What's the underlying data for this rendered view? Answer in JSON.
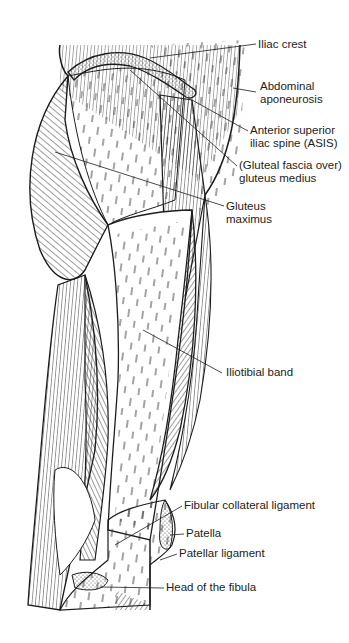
{
  "figure": {
    "line_color": "#1c1c1c",
    "background": "#ffffff"
  },
  "labels": [
    {
      "id": "iliac-crest",
      "text": [
        "Iliac crest"
      ],
      "x": 258,
      "y": 38
    },
    {
      "id": "abdominal-aponeurosis",
      "text": [
        "Abdominal",
        "aponeurosis"
      ],
      "x": 260,
      "y": 82
    },
    {
      "id": "asis",
      "text": [
        "Anterior superior",
        "iliac spine (ASIS)"
      ],
      "x": 250,
      "y": 125
    },
    {
      "id": "gluteus-medius",
      "text": [
        "(Gluteal fascia over)",
        "gluteus medius"
      ],
      "x": 239,
      "y": 160
    },
    {
      "id": "gluteus-maximus",
      "text": [
        "Gluteus",
        "maximus"
      ],
      "x": 226,
      "y": 200
    },
    {
      "id": "iliotibial-band",
      "text": [
        "Iliotibial band"
      ],
      "x": 226,
      "y": 366
    },
    {
      "id": "fibular-collateral-ligament",
      "text": [
        "Fibular collateral ligament"
      ],
      "x": 184,
      "y": 500
    },
    {
      "id": "patella",
      "text": [
        "Patella"
      ],
      "x": 186,
      "y": 528
    },
    {
      "id": "patellar-ligament",
      "text": [
        "Patellar ligament"
      ],
      "x": 179,
      "y": 548
    },
    {
      "id": "head-of-fibula",
      "text": [
        "Head of the fibula"
      ],
      "x": 166,
      "y": 582
    }
  ]
}
